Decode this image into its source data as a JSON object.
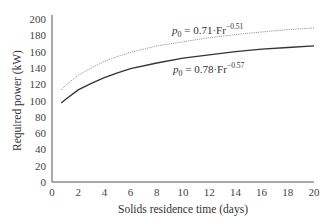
{
  "chart_data": {
    "type": "line",
    "title": "",
    "xlabel": "Solids residence time (days)",
    "ylabel": "Required power (kW)",
    "xlim": [
      0,
      20
    ],
    "ylim": [
      0,
      200
    ],
    "xticks": [
      0,
      2,
      4,
      6,
      8,
      10,
      12,
      14,
      16,
      18,
      20
    ],
    "yticks": [
      0,
      20,
      40,
      60,
      80,
      100,
      120,
      140,
      160,
      180,
      200
    ],
    "grid": false,
    "legend": "inline annotations",
    "x": [
      0.7,
      1,
      2,
      3,
      4,
      5,
      6,
      8,
      10,
      12,
      14,
      16,
      18,
      20
    ],
    "series": [
      {
        "name": "p0 = 0.71·Fr^-0.51",
        "style": "dotted",
        "color": "#999999",
        "values": [
          113,
          118,
          131,
          140,
          148,
          154,
          159,
          167,
          172,
          177,
          181,
          184,
          187,
          189
        ]
      },
      {
        "name": "p0 = 0.78·Fr^-0.57",
        "style": "solid",
        "color": "#333333",
        "values": [
          97,
          101,
          113,
          121,
          128,
          134,
          139,
          146,
          152,
          156,
          160,
          163,
          165,
          167
        ]
      }
    ]
  },
  "annotations": {
    "upper": {
      "p": "p",
      "sub": "0",
      "rest": " = 0.71·Fr",
      "sup": "−0.51"
    },
    "lower": {
      "p": "p",
      "sub": "0",
      "rest": " = 0.78·Fr",
      "sup": "−0.57"
    }
  }
}
